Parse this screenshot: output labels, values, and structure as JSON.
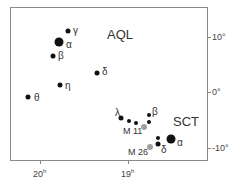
{
  "chart": {
    "constellations": [
      {
        "abbr": "AQL",
        "x": 107,
        "y": 28
      },
      {
        "abbr": "SCT",
        "x": 173,
        "y": 115
      }
    ],
    "y_axis": {
      "ticks": [
        {
          "label": "10°",
          "y": 37
        },
        {
          "label": "0°",
          "y": 92
        },
        {
          "label": "-10°",
          "y": 148
        }
      ]
    },
    "x_axis": {
      "ticks": [
        {
          "label": "20",
          "unit": "h",
          "x": 40
        },
        {
          "label": "19",
          "unit": "h",
          "x": 128
        }
      ]
    },
    "stars": [
      {
        "name": "gamma-aql",
        "label": "γ",
        "x": 68,
        "y": 31,
        "size": 5,
        "color": "#111111",
        "lx": 73,
        "ly": 26
      },
      {
        "name": "alpha-aql",
        "label": "α",
        "x": 59,
        "y": 42,
        "size": 9,
        "color": "#111111",
        "lx": 66,
        "ly": 40
      },
      {
        "name": "beta-aql",
        "label": "β",
        "x": 53,
        "y": 56,
        "size": 5,
        "color": "#111111",
        "lx": 58,
        "ly": 51
      },
      {
        "name": "delta-aql",
        "label": "δ",
        "x": 97,
        "y": 73,
        "size": 5,
        "color": "#111111",
        "lx": 102,
        "ly": 67
      },
      {
        "name": "eta-aql",
        "label": "η",
        "x": 60,
        "y": 85,
        "size": 5,
        "color": "#111111",
        "lx": 65,
        "ly": 81
      },
      {
        "name": "theta-aql",
        "label": "θ",
        "x": 28,
        "y": 97,
        "size": 5,
        "color": "#111111",
        "lx": 34,
        "ly": 93
      },
      {
        "name": "lambda-aql",
        "label": "λ",
        "x": 121,
        "y": 118,
        "size": 5,
        "color": "#111111",
        "lx": 115,
        "ly": 108
      },
      {
        "name": "star-a",
        "label": "",
        "x": 129,
        "y": 121,
        "size": 4,
        "color": "#111111"
      },
      {
        "name": "star-b",
        "label": "",
        "x": 136,
        "y": 123,
        "size": 4,
        "color": "#111111"
      },
      {
        "name": "beta-sct",
        "label": "β",
        "x": 149,
        "y": 115,
        "size": 4,
        "color": "#111111",
        "lx": 152,
        "ly": 107
      },
      {
        "name": "star-c",
        "label": "",
        "x": 149,
        "y": 122,
        "size": 4,
        "color": "#111111"
      },
      {
        "name": "m11",
        "label": "M 11",
        "x": 144,
        "y": 127,
        "size": 6,
        "color": "#a0a0a0",
        "lx": 123,
        "ly": 127
      },
      {
        "name": "star-d",
        "label": "",
        "x": 158,
        "y": 138,
        "size": 4,
        "color": "#111111"
      },
      {
        "name": "delta-sct",
        "label": "δ",
        "x": 158,
        "y": 144,
        "size": 5,
        "color": "#111111",
        "lx": 161,
        "ly": 145
      },
      {
        "name": "alpha-sct",
        "label": "α",
        "x": 171,
        "y": 139,
        "size": 9,
        "color": "#111111",
        "lx": 177,
        "ly": 138
      },
      {
        "name": "m26",
        "label": "M 26",
        "x": 150,
        "y": 147,
        "size": 6,
        "color": "#a0a0a0",
        "lx": 128,
        "ly": 148
      }
    ]
  }
}
